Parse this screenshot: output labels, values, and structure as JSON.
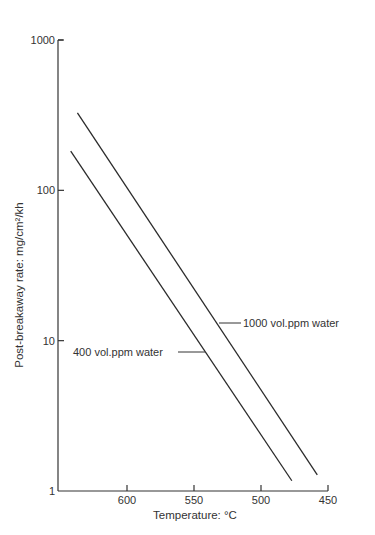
{
  "chart_data": {
    "type": "line",
    "title": "",
    "xlabel": "Temperature: °C",
    "ylabel": "Post-breakaway rate: mg/cm²/kh",
    "yscale": "log",
    "ylim": [
      1,
      1000
    ],
    "xlim": [
      651,
      450
    ],
    "x_reversed": true,
    "grid": false,
    "x_ticks": [
      600,
      550,
      500,
      450
    ],
    "x_tick_labels": [
      "600",
      "550",
      "500",
      "450"
    ],
    "y_ticks": [
      1,
      10,
      100,
      1000
    ],
    "y_tick_labels": [
      "1",
      "10",
      "100",
      "1000"
    ],
    "series": [
      {
        "name": "1000 vol.ppm water",
        "x": [
          637,
          458
        ],
        "y": [
          327,
          1.28
        ]
      },
      {
        "name": "400 vol.ppm water",
        "x": [
          642,
          477
        ],
        "y": [
          182,
          1.17
        ]
      }
    ],
    "annotations": [
      {
        "text": "1000 vol.ppm water",
        "points_to_series": "1000 vol.ppm water"
      },
      {
        "text": "400 vol.ppm water",
        "points_to_series": "400 vol.ppm water"
      }
    ],
    "legend_position": "inline-annotations"
  },
  "colors": {
    "line": "#2b2b2b",
    "axis": "#333333",
    "text": "#333333",
    "background": "#ffffff"
  }
}
